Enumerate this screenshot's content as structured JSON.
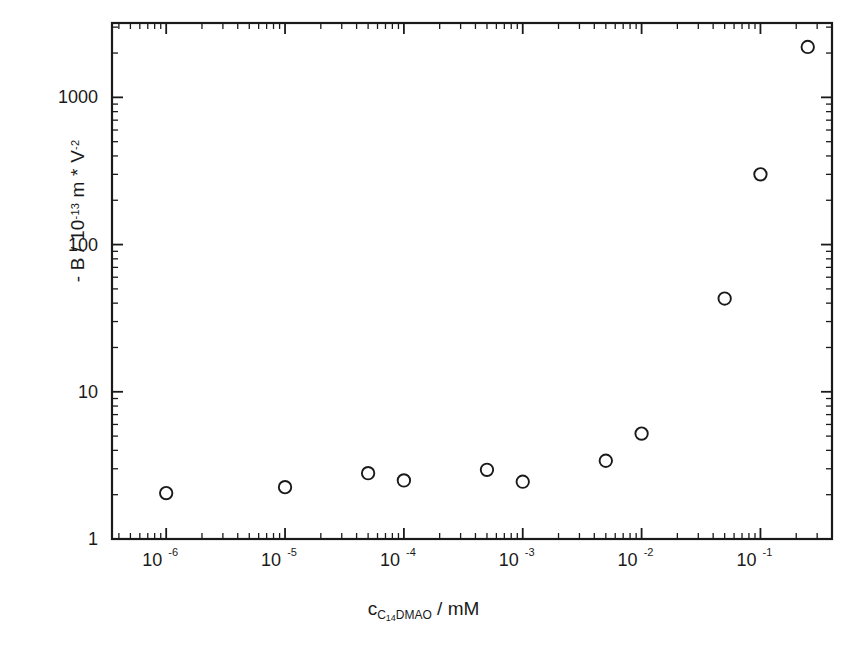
{
  "figure": {
    "background": "#ffffff",
    "frame_color": "#1a1a1a",
    "marker_color": "#1a1a1a",
    "marker_fill": "#ffffff",
    "caption_fragment": ""
  },
  "axes": {
    "x_label_main": "c",
    "x_label_sub_pre": "C",
    "x_label_sub_num": "14",
    "x_label_sub_post": "DMAO",
    "x_label_unit": " / mM",
    "y_label": "- B / 10",
    "y_label_exp1": "-13",
    "y_label_mid": " m * V",
    "y_label_exp2": "-2",
    "x_ticks": [
      "10",
      "10",
      "10",
      "10",
      "10",
      "10"
    ],
    "x_tick_exps": [
      "-6",
      "-5",
      "-4",
      "-3",
      "-2",
      "-1"
    ],
    "y_ticks": [
      "1",
      "10",
      "100",
      "1000"
    ]
  },
  "chart_data": {
    "type": "scatter",
    "title": "",
    "xlabel": "c_C14DMAO / mM",
    "ylabel": "- B / 10^-13 m * V^-2",
    "xscale": "log",
    "yscale": "log",
    "xlim": [
      3.5e-07,
      0.4
    ],
    "ylim": [
      1,
      3200
    ],
    "grid": false,
    "legend": null,
    "marker": "open-circle",
    "x": [
      1e-06,
      1e-05,
      5e-05,
      0.0001,
      0.0005,
      0.001,
      0.005,
      0.01,
      0.05,
      0.1,
      0.25
    ],
    "y": [
      2.05,
      2.25,
      2.8,
      2.5,
      2.95,
      2.45,
      3.4,
      5.2,
      43,
      300,
      2200
    ],
    "x_tick_values": [
      1e-06,
      1e-05,
      0.0001,
      0.001,
      0.01,
      0.1
    ],
    "y_tick_values": [
      1,
      10,
      100,
      1000
    ]
  }
}
